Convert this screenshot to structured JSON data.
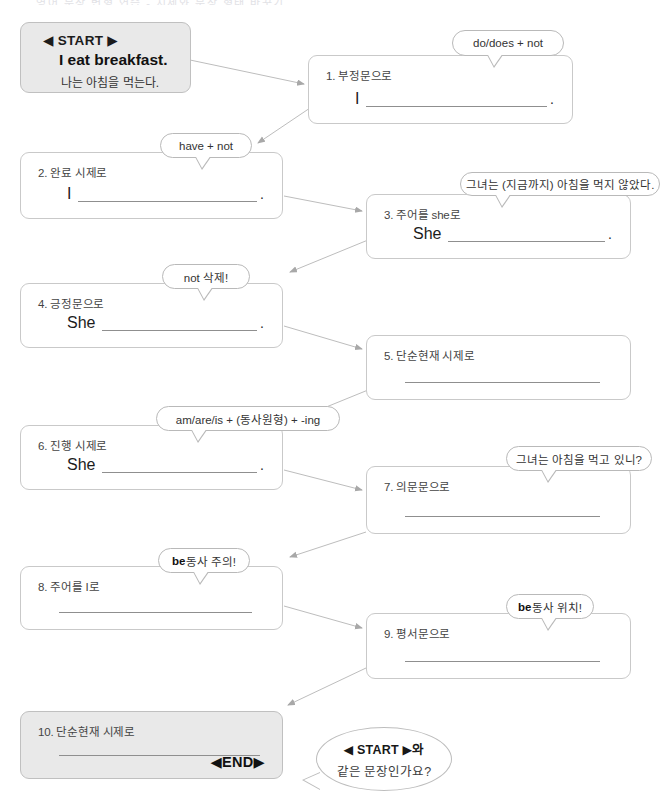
{
  "worksheet": {
    "header_fragment": "영어 문장 변형 연습 - 시제와 문장 형태 바꾸기",
    "start": {
      "tag": "◀ START ▶",
      "english": "I eat breakfast.",
      "korean": "나는 아침을 먹는다."
    },
    "end_tag": "◀END▶",
    "end_question": {
      "line1": "◀ START ▶와",
      "line2": "같은 문장인가요?"
    },
    "steps": [
      {
        "number": "1",
        "label": "1. 부정문으로",
        "subject": "I",
        "period": ".",
        "bubble": "do/does + not"
      },
      {
        "number": "2",
        "label": "2. 완료 시제로",
        "subject": "I",
        "period": ".",
        "bubble": "have + not"
      },
      {
        "number": "3",
        "label": "3. 주어를 she로",
        "subject": "She",
        "period": ".",
        "bubble": "그녀는 (지금까지) 아침을 먹지 않았다."
      },
      {
        "number": "4",
        "label": "4. 긍정문으로",
        "subject": "She",
        "period": ".",
        "bubble": "not 삭제!"
      },
      {
        "number": "5",
        "label": "5. 단순현재 시제로",
        "subject": "",
        "period": "",
        "bubble": ""
      },
      {
        "number": "6",
        "label": "6. 진행 시제로",
        "subject": "She",
        "period": ".",
        "bubble": "am/are/is + (동사원형) + -ing"
      },
      {
        "number": "7",
        "label": "7. 의문문으로",
        "subject": "",
        "period": "",
        "bubble": "그녀는 아침을 먹고 있니?"
      },
      {
        "number": "8",
        "label": "8. 주어를 I로",
        "subject": "",
        "period": "",
        "bubble_pre": "be",
        "bubble_post": "동사 주의!"
      },
      {
        "number": "9",
        "label": "9. 평서문으로",
        "subject": "",
        "period": "",
        "bubble_pre": "be",
        "bubble_post": "동사 위치!"
      },
      {
        "number": "10",
        "label": "10. 단순현재 시제로",
        "subject": "",
        "period": "",
        "bubble": ""
      }
    ],
    "colors": {
      "box_border": "#c9c9c9",
      "box_fill_start": "#e9e9e9",
      "connector": "#b0b0b0",
      "blank_line": "#8f8f8f",
      "text": "#3a3a3a"
    }
  }
}
